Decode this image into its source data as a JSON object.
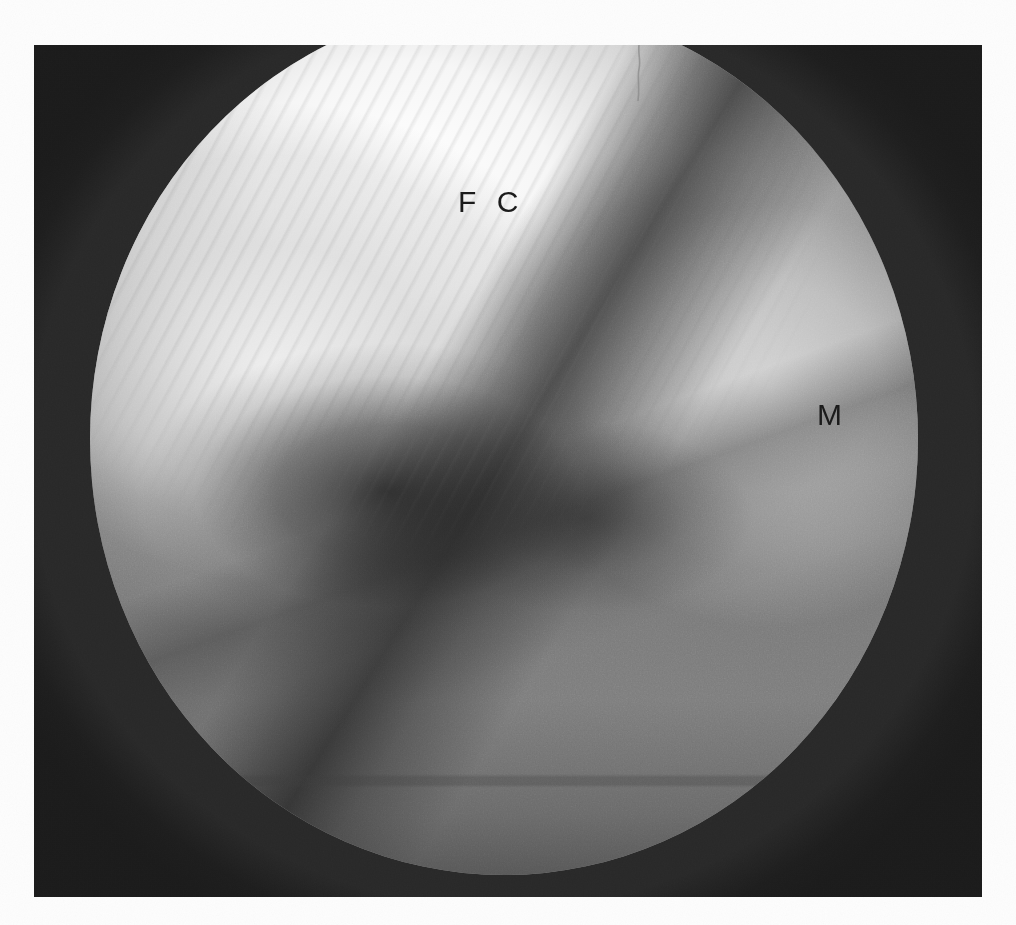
{
  "document": {
    "type": "scanned-photograph",
    "background_color": "#fdfdfd"
  },
  "figure": {
    "name": "arthroscopic-photograph",
    "modality": "knee arthroscopy",
    "view": "circular endoscopic field of view",
    "plate": {
      "x": 34,
      "y": 45,
      "width": 948,
      "height": 852,
      "border_color": "#282828"
    },
    "scope_field": {
      "shape": "circle",
      "center_x": 502,
      "center_y": 455,
      "diameter": 828,
      "surround_color": "#282828"
    },
    "palette": {
      "cartilage_highlight": "#ffffff",
      "cartilage_mid": "#e2e2e2",
      "meniscus": "#c4c4c4",
      "tibial_plateau": "#7c7c7c",
      "joint_cleft_shadow": "#1c1c1c",
      "frame_surround": "#282828",
      "label_color": "#1b1b1b",
      "paper": "#fdfdfd"
    },
    "annotations": [
      {
        "id": "fc",
        "label": "F C",
        "meaning": "femoral condyle",
        "x": 424,
        "y": 142
      },
      {
        "id": "m",
        "label": "M",
        "meaning": "meniscus",
        "x": 783,
        "y": 355
      }
    ],
    "artifacts": [
      {
        "id": "scratch",
        "description": "thin vertical hair/scratch artifact near top edge",
        "x": 598,
        "y": 0
      },
      {
        "id": "scanline",
        "description": "faint horizontal dashed band in lower field",
        "y": 775
      }
    ]
  }
}
